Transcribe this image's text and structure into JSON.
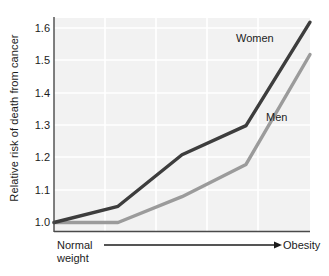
{
  "chart_data": {
    "type": "line",
    "title": "",
    "xlabel": "",
    "ylabel": "Relative risk of death from cancer",
    "x_axis_start_label": "Normal weight",
    "x_axis_start_label_line1": "Normal",
    "x_axis_start_label_line2": "weight",
    "x_axis_end_label": "Obesity",
    "x_axis_style": "arrow",
    "ylim": [
      0.98,
      1.64
    ],
    "yticks": [
      "1.0",
      "1.1",
      "1.2",
      "1.3",
      "1.4",
      "1.5",
      "1.6"
    ],
    "ytick_values": [
      1.0,
      1.1,
      1.2,
      1.3,
      1.4,
      1.5,
      1.6
    ],
    "grid": true,
    "grid_color": "#ffffff",
    "plot_background": "#f2f2f2",
    "legend_position": "inline-labels",
    "x": [
      0,
      1,
      2,
      3,
      4
    ],
    "series": [
      {
        "name": "Women",
        "color": "#3d3d3d",
        "values": [
          1.0,
          1.05,
          1.21,
          1.3,
          1.62
        ]
      },
      {
        "name": "Men",
        "color": "#9b9b9b",
        "values": [
          1.0,
          1.0,
          1.08,
          1.18,
          1.52
        ]
      }
    ]
  },
  "axis": {
    "label_color": "#1c1c1c",
    "spine_color": "#4a4a4a"
  }
}
